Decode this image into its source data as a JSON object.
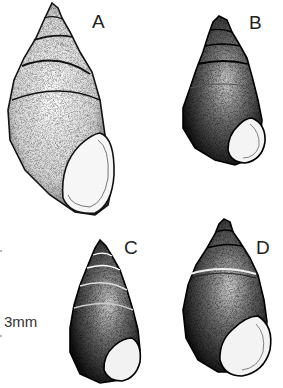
{
  "figure": {
    "type": "scientific illustration",
    "specimens": [
      {
        "label": "A",
        "shape": "elongate conical, pale stippled, large aperture"
      },
      {
        "label": "B",
        "shape": "turreted, dark stippled, round aperture"
      },
      {
        "label": "C",
        "shape": "conical, dark stippled, small aperture"
      },
      {
        "label": "D",
        "shape": "ovate, dark stippled, flared aperture"
      }
    ],
    "scale_bar": {
      "label": "3mm"
    }
  }
}
